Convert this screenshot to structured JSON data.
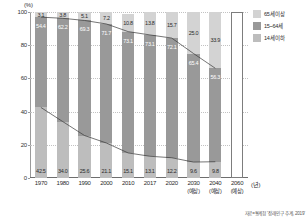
{
  "chart_data": {
    "type": "bar",
    "title": "",
    "subtitle": "",
    "unit_label": "(%)",
    "xlabel": "(년)",
    "ylabel": "",
    "ylim": [
      0,
      100
    ],
    "yticks": [
      "0",
      "20",
      "40",
      "60",
      "80",
      "100"
    ],
    "grid": true,
    "stacked": true,
    "legend_position": "right",
    "categories": [
      "1970",
      "1980",
      "1990",
      "2000",
      "2010",
      "2017",
      "2020",
      "2030",
      "2040",
      "2060"
    ],
    "category_notes": [
      "",
      "",
      "",
      "",
      "",
      "",
      "",
      "(예상)",
      "(예상)",
      "(예상)"
    ],
    "projected_flags": [
      false,
      false,
      false,
      false,
      false,
      false,
      false,
      false,
      false,
      true
    ],
    "series": [
      {
        "name": "65세 이상",
        "color": "#d3d3d3",
        "values": [
          3.1,
          3.8,
          5.1,
          7.2,
          10.8,
          13.8,
          15.7,
          25.0,
          33.9,
          null
        ]
      },
      {
        "name": "15~64세",
        "color": "#999999",
        "values": [
          54.4,
          62.2,
          69.3,
          71.7,
          73.1,
          73.1,
          72.1,
          65.4,
          56.3,
          null
        ]
      },
      {
        "name": "14세 이하",
        "color": "#bdbdbd",
        "values": [
          42.5,
          34.0,
          25.6,
          21.1,
          15.1,
          13.1,
          12.2,
          9.6,
          9.8,
          null
        ]
      }
    ],
    "annotations": [
      {
        "text": "3.1",
        "series": "65세 이상",
        "category": "1970"
      },
      {
        "text": "3.8",
        "series": "65세 이상",
        "category": "1980"
      },
      {
        "text": "5.1",
        "series": "65세 이상",
        "category": "1990"
      },
      {
        "text": "7.2",
        "series": "65세 이상",
        "category": "2000"
      },
      {
        "text": "10.8",
        "series": "65세 이상",
        "category": "2010"
      },
      {
        "text": "13.8",
        "series": "65세 이상",
        "category": "2017"
      },
      {
        "text": "15.7",
        "series": "65세 이상",
        "category": "2020"
      },
      {
        "text": "25.0",
        "series": "65세 이상",
        "category": "2030"
      },
      {
        "text": "33.9",
        "series": "65세 이상",
        "category": "2040"
      },
      {
        "text": "54.4",
        "series": "15~64세",
        "category": "1970"
      },
      {
        "text": "62.2",
        "series": "15~64세",
        "category": "1980"
      },
      {
        "text": "69.3",
        "series": "15~64세",
        "category": "1990"
      },
      {
        "text": "71.7",
        "series": "15~64세",
        "category": "2000"
      },
      {
        "text": "73.1",
        "series": "15~64세",
        "category": "2010"
      },
      {
        "text": "73.1",
        "series": "15~64세",
        "category": "2017"
      },
      {
        "text": "72.1",
        "series": "15~64세",
        "category": "2020"
      },
      {
        "text": "65.4",
        "series": "15~64세",
        "category": "2030"
      },
      {
        "text": "56.3",
        "series": "15~64세",
        "category": "2040"
      },
      {
        "text": "42.5",
        "series": "14세 이하",
        "category": "1970"
      },
      {
        "text": "34.0",
        "series": "14세 이하",
        "category": "1980"
      },
      {
        "text": "25.6",
        "series": "14세 이하",
        "category": "1990"
      },
      {
        "text": "21.1",
        "series": "14세 이하",
        "category": "2000"
      },
      {
        "text": "15.1",
        "series": "14세 이하",
        "category": "2010"
      },
      {
        "text": "13.1",
        "series": "14세 이하",
        "category": "2017"
      },
      {
        "text": "12.2",
        "series": "14세 이하",
        "category": "2020"
      },
      {
        "text": "9.6",
        "series": "14세 이하",
        "category": "2030"
      },
      {
        "text": "9.8",
        "series": "14세 이하",
        "category": "2040"
      }
    ]
  },
  "legend": {
    "items": [
      {
        "label": "65세 이상",
        "swatch": "sw-old"
      },
      {
        "label": "15~64세",
        "swatch": "sw-work"
      },
      {
        "label": "14세 이하",
        "swatch": "sw-young"
      }
    ]
  },
  "source": {
    "text": "자료=통계청 '장래 인구 추계, 2019'"
  }
}
